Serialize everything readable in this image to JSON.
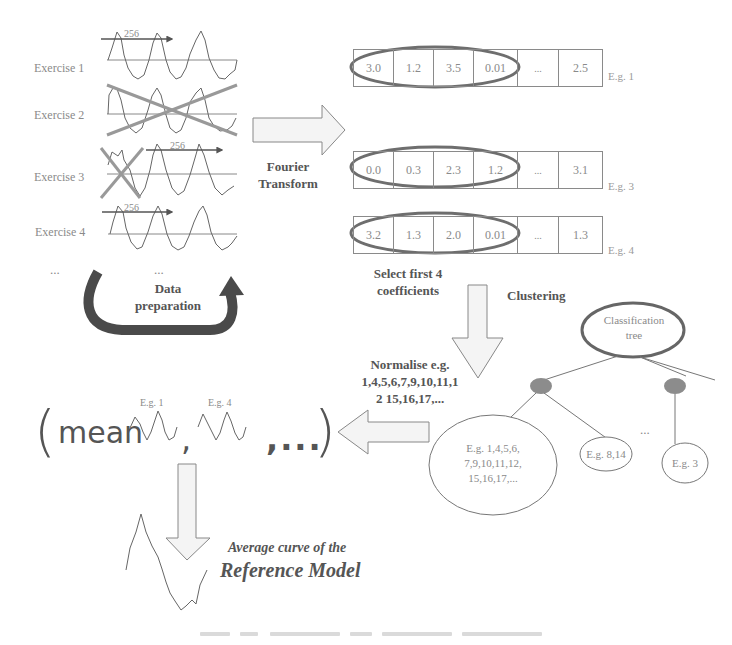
{
  "exercises": [
    {
      "label": "Exercise 1",
      "window_label": "256",
      "crossed": "none"
    },
    {
      "label": "Exercise 2",
      "window_label": "",
      "crossed": "full"
    },
    {
      "label": "Exercise 3",
      "window_label": "256",
      "crossed": "start"
    },
    {
      "label": "Exercise 4",
      "window_label": "256",
      "crossed": "none"
    }
  ],
  "ellipsis_left": "...",
  "ellipsis_mid": "...",
  "data_preparation": {
    "line1": "Data",
    "line2": "preparation"
  },
  "fourier": {
    "line1": "Fourier",
    "line2": "Transform"
  },
  "coefficient_rows": [
    {
      "values": [
        "3.0",
        "1.2",
        "3.5",
        "0.01",
        "...",
        "2.5"
      ],
      "label": "E.g. 1"
    },
    {
      "values": [
        "0.0",
        "0.3",
        "2.3",
        "1.2",
        "...",
        "3.1"
      ],
      "label": "E.g. 3"
    },
    {
      "values": [
        "3.2",
        "1.3",
        "2.0",
        "0.01",
        "...",
        "1.3"
      ],
      "label": "E.g. 4"
    }
  ],
  "select_coefficients": {
    "line1": "Select first 4",
    "line2": "coefficients"
  },
  "clustering_label": "Clustering",
  "tree": {
    "root": {
      "line1": "Classification",
      "line2": "tree"
    },
    "leaves": [
      {
        "line1": "E.g. 1,4,5,6,",
        "line2": "7,9,10,11,12,",
        "line3": "15,16,17,..."
      },
      {
        "line1": "E.g. 8,14"
      },
      {
        "line1": "E.g. 3"
      }
    ],
    "ellipsis": "..."
  },
  "normalise": {
    "line1": "Normalise e.g.",
    "line2": "1,4,5,6,7,9,10,11,1",
    "line3": "2 15,16,17,..."
  },
  "mean_expression": {
    "open_paren": "(",
    "mean_word": "mean",
    "curve1_label": "E.g. 1",
    "curve2_label": "E.g. 4",
    "comma": ",",
    "trailing": ",...",
    "close_paren": ")"
  },
  "result": {
    "line1": "Average curve of the",
    "line2": "Reference Model"
  },
  "colors": {
    "text_gray": "#777777",
    "line_gray": "#8a8a8a",
    "highlight_ellipse": "#6e6e6e",
    "cross_line": "#9a9a9a",
    "dark_arrow": "#4a4a4a",
    "node_fill": "#8c8c8c",
    "arrow_fill": "#f4f4f4"
  }
}
